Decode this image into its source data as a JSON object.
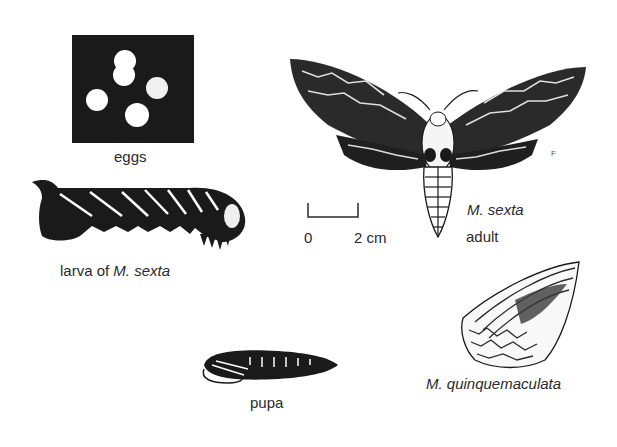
{
  "figure": {
    "stages": {
      "eggs": {
        "label": "eggs"
      },
      "larva": {
        "label_prefix": "larva of ",
        "label_species": "M. sexta"
      },
      "pupa": {
        "label": "pupa"
      },
      "adult": {
        "species": "M. sexta",
        "label": "adult"
      },
      "related": {
        "species": "M. quinquemaculata"
      }
    },
    "scale_bar": {
      "start": "0",
      "end": "2 cm"
    },
    "artist_mark": "F"
  },
  "colors": {
    "ink": "#1a1a1a",
    "background": "#ffffff"
  }
}
